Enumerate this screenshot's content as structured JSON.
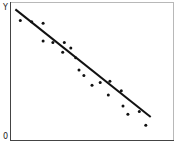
{
  "chart_data": {
    "type": "scatter",
    "title": "",
    "xlabel": "",
    "ylabel": "Y",
    "origin_label": "0",
    "grid": false,
    "legend": null,
    "xlim": [
      0,
      100
    ],
    "ylim": [
      0,
      100
    ],
    "points": [
      {
        "x": 6,
        "y": 87
      },
      {
        "x": 13,
        "y": 86
      },
      {
        "x": 20,
        "y": 85
      },
      {
        "x": 20,
        "y": 72
      },
      {
        "x": 26,
        "y": 71
      },
      {
        "x": 33,
        "y": 71
      },
      {
        "x": 37,
        "y": 67
      },
      {
        "x": 32,
        "y": 64
      },
      {
        "x": 40,
        "y": 60
      },
      {
        "x": 42,
        "y": 51
      },
      {
        "x": 45,
        "y": 47
      },
      {
        "x": 50,
        "y": 40
      },
      {
        "x": 55,
        "y": 42
      },
      {
        "x": 61,
        "y": 43
      },
      {
        "x": 60,
        "y": 33
      },
      {
        "x": 68,
        "y": 36
      },
      {
        "x": 69,
        "y": 25
      },
      {
        "x": 72,
        "y": 19
      },
      {
        "x": 79,
        "y": 21
      },
      {
        "x": 83,
        "y": 11
      }
    ],
    "trend_line": {
      "x1": 3,
      "y1": 95,
      "x2": 86,
      "y2": 17
    },
    "colors": {
      "points": "#111111",
      "line": "#111111",
      "frame": "#444444"
    }
  }
}
